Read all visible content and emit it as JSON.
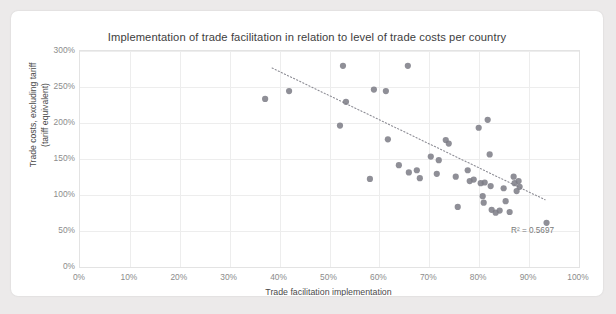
{
  "chart_data": {
    "type": "scatter",
    "title": "Implementation of trade facilitation in relation to level of trade costs per country",
    "xlabel": "Trade facilitation implementation",
    "ylabel": "Trade costs, excluding tariff (tariff equivalent)",
    "ylabel_line1": "Trade costs, excluding tariff",
    "ylabel_line2": "(tariff equivalent)",
    "xlim": [
      0,
      100
    ],
    "ylim": [
      0,
      300
    ],
    "x_unit": "%",
    "y_unit": "%",
    "xticks": [
      "0%",
      "10%",
      "20%",
      "30%",
      "40%",
      "50%",
      "60%",
      "70%",
      "80%",
      "90%",
      "100%"
    ],
    "yticks": [
      "0%",
      "50%",
      "100%",
      "150%",
      "200%",
      "250%",
      "300%"
    ],
    "xtick_values": [
      0,
      10,
      20,
      30,
      40,
      50,
      60,
      70,
      80,
      90,
      100
    ],
    "ytick_values": [
      0,
      50,
      100,
      150,
      200,
      250,
      300
    ],
    "grid": true,
    "legend": false,
    "marker_color": "#7d7d86",
    "trendline": {
      "type": "linear-dotted",
      "x_start": 38.7,
      "y_start": 275,
      "x_end": 93.4,
      "y_end": 92,
      "color": "#8d8d95",
      "annotation": "R² = 0.5697",
      "r_squared": 0.5697
    },
    "points": [
      {
        "x": 37.3,
        "y": 232
      },
      {
        "x": 42.1,
        "y": 243
      },
      {
        "x": 52.3,
        "y": 195
      },
      {
        "x": 52.9,
        "y": 278
      },
      {
        "x": 53.5,
        "y": 228
      },
      {
        "x": 58.3,
        "y": 121
      },
      {
        "x": 59.1,
        "y": 245
      },
      {
        "x": 61.5,
        "y": 243
      },
      {
        "x": 61.9,
        "y": 176
      },
      {
        "x": 65.9,
        "y": 278
      },
      {
        "x": 64.1,
        "y": 140
      },
      {
        "x": 66.1,
        "y": 130
      },
      {
        "x": 67.7,
        "y": 133
      },
      {
        "x": 68.3,
        "y": 122
      },
      {
        "x": 70.5,
        "y": 152
      },
      {
        "x": 71.7,
        "y": 128
      },
      {
        "x": 72.1,
        "y": 147
      },
      {
        "x": 73.5,
        "y": 175
      },
      {
        "x": 74.1,
        "y": 170
      },
      {
        "x": 75.5,
        "y": 124
      },
      {
        "x": 75.9,
        "y": 82
      },
      {
        "x": 77.9,
        "y": 133
      },
      {
        "x": 78.3,
        "y": 118
      },
      {
        "x": 79.1,
        "y": 120
      },
      {
        "x": 80.1,
        "y": 192
      },
      {
        "x": 80.5,
        "y": 115
      },
      {
        "x": 80.9,
        "y": 97
      },
      {
        "x": 81.1,
        "y": 88
      },
      {
        "x": 81.3,
        "y": 116
      },
      {
        "x": 81.9,
        "y": 203
      },
      {
        "x": 82.3,
        "y": 155
      },
      {
        "x": 82.5,
        "y": 111
      },
      {
        "x": 82.7,
        "y": 78
      },
      {
        "x": 83.5,
        "y": 74
      },
      {
        "x": 84.3,
        "y": 77
      },
      {
        "x": 85.1,
        "y": 108
      },
      {
        "x": 85.5,
        "y": 90
      },
      {
        "x": 86.3,
        "y": 75
      },
      {
        "x": 87.1,
        "y": 124
      },
      {
        "x": 87.3,
        "y": 115
      },
      {
        "x": 87.7,
        "y": 104
      },
      {
        "x": 88.1,
        "y": 118
      },
      {
        "x": 88.3,
        "y": 110
      },
      {
        "x": 93.7,
        "y": 60
      }
    ]
  }
}
